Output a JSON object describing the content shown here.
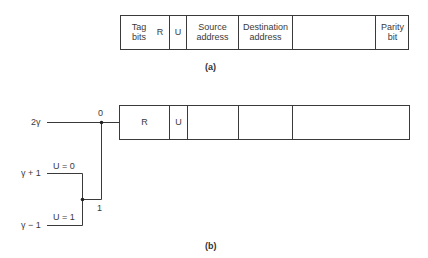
{
  "figure_a": {
    "caption": "(a)",
    "cells": [
      {
        "label": "Tag\nbits"
      },
      {
        "label": "R"
      },
      {
        "label": "U"
      },
      {
        "label": "Source\naddress"
      },
      {
        "label": "Destination\naddress"
      },
      {
        "label": ""
      },
      {
        "label": "Parity\nbit"
      }
    ]
  },
  "figure_b": {
    "caption": "(b)",
    "cells": [
      {
        "label": "R"
      },
      {
        "label": "U"
      },
      {
        "label": ""
      },
      {
        "label": ""
      },
      {
        "label": ""
      }
    ],
    "inputs": {
      "top": "2γ",
      "upper": "γ + 1",
      "lower": "γ − 1"
    },
    "conditions": {
      "upper": "U = 0",
      "lower": "U = 1"
    },
    "switch_labels": {
      "zero": "0",
      "one": "1"
    }
  },
  "colors": {
    "line": "#3a3a3a",
    "background": "#ffffff"
  }
}
